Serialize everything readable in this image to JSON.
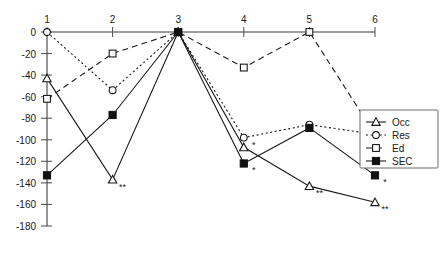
{
  "chart_data": {
    "type": "line",
    "title": "",
    "xlabel": "",
    "ylabel": "",
    "x": [
      1,
      2,
      3,
      4,
      5,
      6
    ],
    "xticklabels": [
      "1",
      "2",
      "3",
      "4",
      "5",
      "6"
    ],
    "yticklabels": [
      "0",
      "-20",
      "-40",
      "-60",
      "-80",
      "-100",
      "-120",
      "-140",
      "-160",
      "-180"
    ],
    "yticks": [
      0,
      -20,
      -40,
      -60,
      -80,
      -100,
      -120,
      -140,
      -160,
      -180
    ],
    "ylim": [
      -180,
      0
    ],
    "xlim": [
      1,
      6
    ],
    "grid": false,
    "axis_position": "top",
    "legend_position": "right",
    "series": [
      {
        "name": "Occ",
        "values": [
          -43,
          -137,
          0,
          -107,
          -143,
          -158
        ],
        "linestyle": "solid",
        "marker": "open-triangle",
        "color": "#1a1a1a"
      },
      {
        "name": "Res",
        "values": [
          0,
          -54,
          0,
          -98,
          -86,
          -95
        ],
        "linestyle": "dotted",
        "marker": "open-circle",
        "color": "#1a1a1a"
      },
      {
        "name": "Ed",
        "values": [
          -62,
          -20,
          0,
          -33,
          0,
          -95
        ],
        "linestyle": "dashed",
        "marker": "open-square",
        "color": "#1a1a1a"
      },
      {
        "name": "SEC",
        "values": [
          -133,
          -77,
          0,
          -122,
          -89,
          -133
        ],
        "linestyle": "solid",
        "marker": "filled-square",
        "color": "#111111"
      }
    ],
    "annotations": [
      {
        "text": "**",
        "x": 2,
        "series": "Occ",
        "value": -137
      },
      {
        "text": "*",
        "x": 4,
        "series": "Res",
        "value": -98
      },
      {
        "text": "*",
        "x": 4,
        "series": "SEC",
        "value": -122
      },
      {
        "text": "**",
        "x": 5,
        "series": "Occ",
        "value": -143
      },
      {
        "text": "*",
        "x": 6,
        "series": "SEC",
        "value": -133
      },
      {
        "text": "**",
        "x": 6,
        "series": "Occ",
        "value": -158
      }
    ],
    "legend_entries": [
      {
        "label": "Occ",
        "marker": "open-triangle",
        "linestyle": "solid"
      },
      {
        "label": "Res",
        "marker": "open-circle",
        "linestyle": "dotted"
      },
      {
        "label": "Ed",
        "marker": "open-square",
        "linestyle": "dashed"
      },
      {
        "label": "SEC",
        "marker": "filled-square",
        "linestyle": "solid"
      }
    ]
  }
}
